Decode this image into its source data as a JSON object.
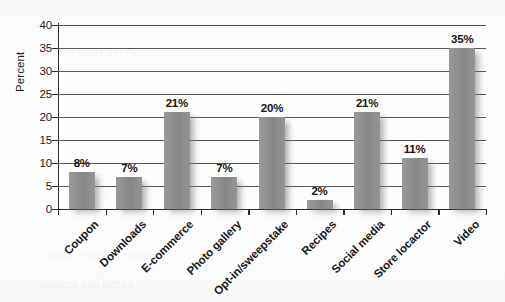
{
  "chart_data": {
    "type": "bar",
    "title": "",
    "subtitle": "",
    "xlabel": "",
    "ylabel": "Percent",
    "ylim": [
      0,
      40
    ],
    "ytick_step": 5,
    "yticks": [
      0,
      5,
      10,
      15,
      20,
      25,
      30,
      35,
      40
    ],
    "ytick_labels": [
      "0",
      "5",
      "10",
      "15",
      "20",
      "25",
      "30",
      "35",
      "40"
    ],
    "grid": "horizontal",
    "legend": "none",
    "value_label_suffix": "%",
    "categories": [
      "Coupon",
      "Downloads",
      "E-commerce",
      "Photo gallery",
      "Opt-in/sweepstake",
      "Recipes",
      "Social media",
      "Store locactor",
      "Video"
    ],
    "values": [
      8,
      7,
      21,
      7,
      20,
      2,
      21,
      11,
      35
    ],
    "value_labels": [
      "8%",
      "7%",
      "21%",
      "7%",
      "20%",
      "2%",
      "21%",
      "11%",
      "35%"
    ],
    "bar_color": "#8e8e8e",
    "axis_color": "#2c2c2c",
    "grid_color": "#55585a",
    "background_color": "#fdfdfd",
    "text_color": "#181818"
  },
  "bleed_text": [
    "the chart below",
    "most common features",
    "content marketing"
  ]
}
